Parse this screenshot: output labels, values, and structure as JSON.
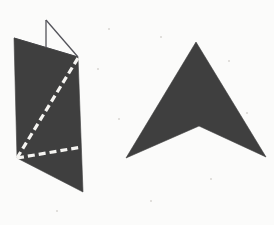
{
  "canvas": {
    "width": 274,
    "height": 225,
    "background_color": "#fbfbfa",
    "title": "Two geometric solids"
  },
  "palette": {
    "shape_fill": "#3f3f3f",
    "outline_stroke": "#53535a",
    "dashed_stroke": "#f5f4f1",
    "background": "#fbfbfa",
    "fleck": "#d8d6d2"
  },
  "figures": [
    {
      "id": "left-figure",
      "name": "folded-prism-figure",
      "description": "Dark quadrilateral face of a folded sheet with a thin open triangular flap at the top and two white dashed fold lines",
      "fill": "#3f3f3f",
      "parts": [
        {
          "id": "left-main-face",
          "name": "prism-front-face",
          "type": "polygon",
          "points": "14,38 78,57 83,192 17,158",
          "fill": "#3f3f3f"
        },
        {
          "id": "left-flap-vertical",
          "name": "flap-vertical-edge",
          "type": "line",
          "x1": 46,
          "y1": 20,
          "x2": 46,
          "y2": 48,
          "stroke": "#53535a",
          "stroke_width": 1.3
        },
        {
          "id": "left-flap-diagonal",
          "name": "flap-diagonal-edge",
          "type": "line",
          "x1": 46,
          "y1": 20,
          "x2": 78,
          "y2": 57,
          "stroke": "#53535a",
          "stroke_width": 1.3
        },
        {
          "id": "left-flap-base",
          "name": "flap-base-edge",
          "type": "line",
          "x1": 14,
          "y1": 38,
          "x2": 78,
          "y2": 57,
          "stroke": "#53535a",
          "stroke_width": 1.0
        },
        {
          "id": "left-dashed-diagonal",
          "name": "fold-line-diagonal",
          "type": "dashed-line",
          "x1": 17,
          "y1": 158,
          "x2": 78,
          "y2": 58,
          "stroke": "#f5f4f1",
          "stroke_width": 3.2,
          "dash_pattern": "7 4"
        },
        {
          "id": "left-dashed-horizontal",
          "name": "fold-line-horizontal",
          "type": "dashed-line",
          "x1": 17,
          "y1": 158,
          "x2": 82,
          "y2": 147,
          "stroke": "#f5f4f1",
          "stroke_width": 3.2,
          "dash_pattern": "7 4"
        }
      ]
    },
    {
      "id": "right-figure",
      "name": "chevron-arrowhead-figure",
      "description": "Solid dark concave quadrilateral shaped like an upward pointing arrowhead or chevron",
      "fill": "#3f3f3f",
      "parts": [
        {
          "id": "right-chevron-body",
          "name": "chevron-body",
          "type": "polygon",
          "points": "196,42 266,157 199,126 126,158",
          "fill": "#3f3f3f"
        }
      ],
      "vertices": {
        "apex": [
          196,
          42
        ],
        "bottom_right_tip": [
          266,
          157
        ],
        "inner_notch": [
          199,
          126
        ],
        "bottom_left_tip": [
          126,
          158
        ]
      }
    }
  ],
  "flecks": [
    {
      "x": 108,
      "y": 28,
      "size": 2
    },
    {
      "x": 160,
      "y": 36,
      "size": 2
    },
    {
      "x": 228,
      "y": 60,
      "size": 2
    },
    {
      "x": 97,
      "y": 68,
      "size": 2
    },
    {
      "x": 246,
      "y": 112,
      "size": 2
    },
    {
      "x": 118,
      "y": 118,
      "size": 2
    },
    {
      "x": 210,
      "y": 178,
      "size": 2
    },
    {
      "x": 56,
      "y": 210,
      "size": 2
    },
    {
      "x": 150,
      "y": 200,
      "size": 2
    }
  ]
}
